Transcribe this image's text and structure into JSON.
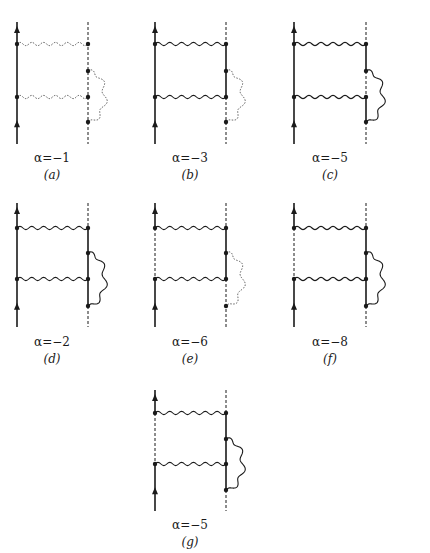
{
  "figure": {
    "panels": [
      {
        "id": "a",
        "alpha_label": "α=−1",
        "panel_label": "(a)",
        "origin": [
          17,
          22
        ],
        "bottom": 144,
        "width": 71,
        "y": {
          "top_photon": 44,
          "loop_start": 71,
          "low_photon": 97,
          "loop_end": 122
        },
        "left_segments": [
          [
            "top",
            "bottom",
            "solid"
          ]
        ],
        "right_segments": [
          [
            "top",
            "bottom",
            "dashed"
          ]
        ],
        "photons": {
          "top": "dotted",
          "low": "dotted",
          "loop": "dotted"
        },
        "label_y": [
          151,
          168
        ]
      },
      {
        "id": "b",
        "alpha_label": "α=−3",
        "panel_label": "(b)",
        "origin": [
          155,
          22
        ],
        "bottom": 144,
        "width": 71,
        "y": {
          "top_photon": 44,
          "loop_start": 71,
          "low_photon": 97,
          "loop_end": 122
        },
        "left_segments": [
          [
            "top",
            "bottom",
            "solid"
          ]
        ],
        "right_segments": [
          [
            "top",
            "top_photon",
            "dashed"
          ],
          [
            "top_photon",
            "low_photon",
            "solid"
          ],
          [
            "low_photon",
            "bottom",
            "dashed"
          ]
        ],
        "photons": {
          "top": "solid",
          "low": "solid",
          "loop": "dotted"
        },
        "label_y": [
          151,
          168
        ]
      },
      {
        "id": "c",
        "alpha_label": "α=−5",
        "panel_label": "(c)",
        "origin": [
          294,
          22
        ],
        "bottom": 144,
        "width": 72,
        "y": {
          "top_photon": 44,
          "loop_start": 71,
          "low_photon": 97,
          "loop_end": 122
        },
        "left_segments": [
          [
            "top",
            "bottom",
            "solid"
          ]
        ],
        "right_segments": [
          [
            "top",
            "top_photon",
            "dashed"
          ],
          [
            "top_photon",
            "loop_start",
            "solid"
          ],
          [
            "loop_start",
            "low_photon",
            "dashed"
          ],
          [
            "low_photon",
            "loop_end",
            "solid"
          ],
          [
            "loop_end",
            "bottom",
            "dashed"
          ]
        ],
        "photons": {
          "top": "solid",
          "low": "solid",
          "loop": "solid"
        },
        "label_y": [
          151,
          168
        ]
      },
      {
        "id": "d",
        "alpha_label": "α=−2",
        "panel_label": "(d)",
        "origin": [
          17,
          203
        ],
        "bottom": 327,
        "width": 71,
        "y": {
          "top_photon": 228,
          "loop_start": 253,
          "low_photon": 279,
          "loop_end": 306
        },
        "left_segments": [
          [
            "top",
            "bottom",
            "solid"
          ]
        ],
        "right_segments": [
          [
            "top",
            "top_photon",
            "dashed"
          ],
          [
            "top_photon",
            "loop_end",
            "solid"
          ],
          [
            "loop_end",
            "bottom",
            "dashed"
          ]
        ],
        "photons": {
          "top": "solid",
          "low": "solid",
          "loop": "solid"
        },
        "label_y": [
          335,
          352
        ]
      },
      {
        "id": "e",
        "alpha_label": "α=−6",
        "panel_label": "(e)",
        "origin": [
          155,
          203
        ],
        "bottom": 327,
        "width": 71,
        "y": {
          "top_photon": 228,
          "loop_start": 253,
          "low_photon": 279,
          "loop_end": 306
        },
        "left_segments": [
          [
            "top",
            "top_photon",
            "solid"
          ],
          [
            "top_photon",
            "low_photon",
            "dashed"
          ],
          [
            "low_photon",
            "bottom",
            "solid"
          ]
        ],
        "right_segments": [
          [
            "top",
            "top_photon",
            "dashed"
          ],
          [
            "top_photon",
            "low_photon",
            "solid"
          ],
          [
            "low_photon",
            "bottom",
            "dashed"
          ]
        ],
        "photons": {
          "top": "solid",
          "low": "solid",
          "loop": "dotted"
        },
        "label_y": [
          335,
          352
        ]
      },
      {
        "id": "f",
        "alpha_label": "α=−8",
        "panel_label": "(f)",
        "origin": [
          294,
          203
        ],
        "bottom": 327,
        "width": 72,
        "y": {
          "top_photon": 228,
          "loop_start": 253,
          "low_photon": 279,
          "loop_end": 306
        },
        "left_segments": [
          [
            "top",
            "top_photon",
            "solid"
          ],
          [
            "top_photon",
            "low_photon",
            "dashed"
          ],
          [
            "low_photon",
            "bottom",
            "solid"
          ]
        ],
        "right_segments": [
          [
            "top",
            "top_photon",
            "dashed"
          ],
          [
            "top_photon",
            "loop_end",
            "solid"
          ],
          [
            "loop_end",
            "bottom",
            "dashed"
          ]
        ],
        "photons": {
          "top": "solid",
          "low": "solid",
          "loop": "solid"
        },
        "label_y": [
          335,
          352
        ]
      },
      {
        "id": "g",
        "alpha_label": "α=−5",
        "panel_label": "(g)",
        "origin": [
          155,
          390
        ],
        "bottom": 511,
        "width": 71,
        "y": {
          "top_photon": 413,
          "loop_start": 439,
          "low_photon": 464,
          "loop_end": 490
        },
        "left_segments": [
          [
            "top",
            "top_photon",
            "solid"
          ],
          [
            "top_photon",
            "low_photon",
            "dashed"
          ],
          [
            "low_photon",
            "bottom",
            "solid"
          ]
        ],
        "right_segments": [
          [
            "top",
            "top_photon",
            "dashed"
          ],
          [
            "top_photon",
            "loop_end",
            "solid"
          ],
          [
            "loop_end",
            "bottom",
            "dashed"
          ]
        ],
        "photons": {
          "top": "solid",
          "low": "solid",
          "loop": "solid"
        },
        "label_y": [
          518,
          535
        ]
      }
    ]
  }
}
